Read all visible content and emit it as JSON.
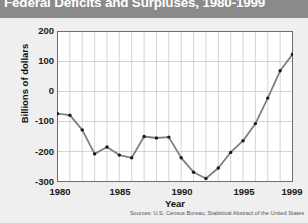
{
  "title": "Federal Deficits and Surpluses, 1980-1999",
  "source_note": "Sources: U.S. Census Bureau, Statistical Abstract of the United States",
  "colors": {
    "title_bar": "#8a8a8a",
    "title_text": "#ffffff",
    "background": "#efefef",
    "plot_background": "#ffffff",
    "grid": "#c9c9c9",
    "axis": "#6e6e6e",
    "line": "#808080",
    "marker": "#1a1a1a"
  },
  "chart_data": {
    "type": "line",
    "title": "Federal Deficits and Surpluses, 1980-1999",
    "xlabel": "Year",
    "ylabel": "Billions of dollars",
    "xlim": [
      1980,
      1999
    ],
    "ylim": [
      -300,
      200
    ],
    "ytick_labels": [
      "200",
      "100",
      "0",
      "-100",
      "-200",
      "-300"
    ],
    "yticks": [
      200,
      100,
      0,
      -100,
      -200,
      -300
    ],
    "xtick_labels": [
      "1980",
      "1985",
      "1990",
      "1995",
      "1999"
    ],
    "xticks": [
      1980,
      1985,
      1990,
      1995,
      1999
    ],
    "grid": true,
    "legend": "none",
    "markers": true,
    "x": [
      1980,
      1981,
      1982,
      1983,
      1984,
      1985,
      1986,
      1987,
      1988,
      1989,
      1990,
      1991,
      1992,
      1993,
      1994,
      1995,
      1996,
      1997,
      1998,
      1999
    ],
    "values": [
      -74,
      -79,
      -128,
      -208,
      -185,
      -212,
      -221,
      -150,
      -155,
      -152,
      -221,
      -269,
      -290,
      -255,
      -203,
      -164,
      -107,
      -22,
      69,
      124
    ],
    "series": [
      {
        "name": "Federal deficit / surplus",
        "values": [
          -74,
          -79,
          -128,
          -208,
          -185,
          -212,
          -221,
          -150,
          -155,
          -152,
          -221,
          -269,
          -290,
          -255,
          -203,
          -164,
          -107,
          -22,
          69,
          124
        ]
      }
    ]
  }
}
